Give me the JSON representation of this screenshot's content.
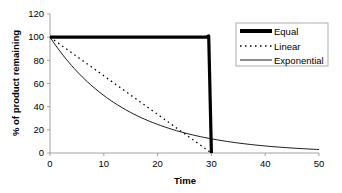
{
  "chart_data": {
    "type": "line",
    "title": "",
    "xlabel": "Time",
    "ylabel": "% of product remaining",
    "xlim": [
      0,
      50
    ],
    "ylim": [
      0,
      120
    ],
    "xticks": [
      0,
      10,
      20,
      30,
      40,
      50
    ],
    "yticks": [
      0,
      20,
      40,
      60,
      80,
      100,
      120
    ],
    "grid": false,
    "legend_position": "upper right",
    "series": [
      {
        "name": "Equal",
        "style": "thick-solid",
        "color": "#000000",
        "x": [
          0,
          29,
          29.5,
          30
        ],
        "y": [
          100,
          100,
          101,
          0
        ]
      },
      {
        "name": "Linear",
        "style": "dotted",
        "color": "#000000",
        "x": [
          0,
          30
        ],
        "y": [
          100,
          0
        ]
      },
      {
        "name": "Exponential",
        "style": "thin-solid",
        "color": "#000000",
        "x": [
          0,
          5,
          10,
          15,
          20,
          25,
          30,
          35,
          40,
          45,
          50
        ],
        "y": [
          100,
          70.5,
          49.7,
          35.0,
          24.7,
          17.4,
          12.2,
          8.6,
          6.1,
          4.3,
          3.0
        ]
      }
    ]
  },
  "legend": {
    "items": [
      "Equal",
      "Linear",
      "Exponential"
    ]
  },
  "axes": {
    "x_title": "Time",
    "y_title": "% of product remaining",
    "x_tick_labels": [
      "0",
      "10",
      "20",
      "30",
      "40",
      "50"
    ],
    "y_tick_labels": [
      "0",
      "20",
      "40",
      "60",
      "80",
      "100",
      "120"
    ]
  }
}
